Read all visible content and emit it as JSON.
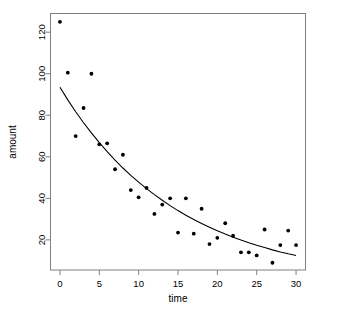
{
  "chart_data": {
    "type": "scatter",
    "title": "",
    "xlabel": "time",
    "ylabel": "amount",
    "xlim": [
      -1.2,
      31.2
    ],
    "ylim": [
      5.5,
      129
    ],
    "grid": false,
    "legend": null,
    "xticks": [
      0,
      5,
      10,
      15,
      20,
      25,
      30
    ],
    "xtick_labels": [
      "0",
      "5",
      "10",
      "15",
      "20",
      "25",
      "30"
    ],
    "yticks": [
      20,
      40,
      60,
      80,
      100,
      120
    ],
    "ytick_labels": [
      "20",
      "40",
      "60",
      "80",
      "100",
      "120"
    ],
    "point_color": "#000000",
    "line_color": "#000000",
    "frame_color": "#808080",
    "series": [
      {
        "name": "observations",
        "marker": "dot",
        "x": [
          0,
          1,
          2,
          3,
          4,
          5,
          6,
          7,
          8,
          9,
          10,
          11,
          12,
          13,
          14,
          15,
          16,
          17,
          18,
          19,
          20,
          21,
          22,
          23,
          24,
          25,
          26,
          27,
          28,
          29,
          30
        ],
        "y": [
          125,
          100.5,
          70,
          83.5,
          100,
          66,
          66.5,
          54,
          61,
          44,
          40.5,
          45,
          32.5,
          37,
          40,
          23.5,
          40,
          23,
          35,
          18,
          21,
          28,
          22,
          14,
          14,
          12.5,
          25,
          9,
          17.5,
          24.5,
          17.5
        ]
      },
      {
        "name": "fitted-exponential-curve",
        "type": "line",
        "equation": "amount = 93.5 * exp(-0.0672 * time)",
        "x": [
          0,
          1,
          2,
          3,
          4,
          5,
          6,
          7,
          8,
          9,
          10,
          11,
          12,
          13,
          14,
          15,
          16,
          17,
          18,
          19,
          20,
          21,
          22,
          23,
          24,
          25,
          26,
          27,
          28,
          29,
          30
        ],
        "y": [
          93.5,
          87.4,
          81.7,
          76.4,
          71.5,
          66.8,
          62.5,
          58.4,
          54.6,
          51.1,
          47.8,
          44.7,
          41.8,
          39.1,
          36.5,
          34.1,
          31.9,
          29.8,
          27.9,
          26.1,
          24.4,
          22.8,
          21.3,
          19.9,
          18.6,
          17.4,
          16.3,
          15.2,
          14.2,
          13.3,
          12.5
        ]
      }
    ]
  }
}
